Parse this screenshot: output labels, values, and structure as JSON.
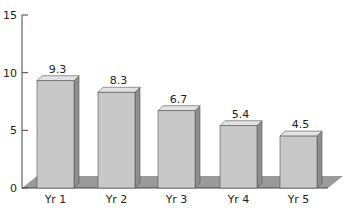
{
  "chart_data": {
    "type": "bar",
    "title": "",
    "xlabel": "",
    "ylabel": "",
    "categories": [
      "Yr 1",
      "Yr 2",
      "Yr 3",
      "Yr 4",
      "Yr 5"
    ],
    "values": [
      9.3,
      8.3,
      6.7,
      5.4,
      4.5
    ],
    "value_labels": [
      "9.3",
      "8.3",
      "6.7",
      "5.4",
      "4.5"
    ],
    "ylim": [
      0,
      15
    ],
    "yticks": [
      0,
      5,
      10,
      15
    ],
    "ytick_labels": [
      "0",
      "5",
      "10",
      "15"
    ],
    "grid": false,
    "legend": null,
    "style": "3d-bar"
  },
  "colors": {
    "bar_front": "#c8c8c8",
    "bar_side": "#8e8e8e",
    "bar_top": "#e2e2e2",
    "bar_edge": "#555555",
    "floor": "#9a9a9a",
    "axis": "#444444",
    "text": "#222222"
  }
}
